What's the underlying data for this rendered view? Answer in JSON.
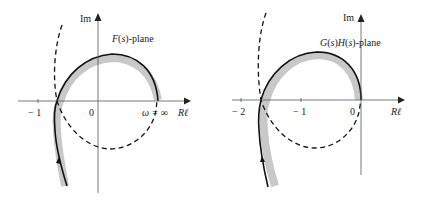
{
  "figures": [
    {
      "id": "left",
      "plane_label": "F(s)-plane",
      "plane_label_parts": {
        "fn": "F",
        "arg": "s",
        "suffix": "-plane"
      },
      "axis_im_label": "Im",
      "axis_re_label": "Rℓ",
      "ticks": [
        {
          "value": -1,
          "label": "− 1"
        },
        {
          "value": 0,
          "label": "0"
        }
      ],
      "annotation": "ω = ∞",
      "curve_style": {
        "solid": "#111111",
        "shade": "#c8c8c8",
        "dashed": "#111111"
      }
    },
    {
      "id": "right",
      "plane_label": "G(s)H(s)-plane",
      "plane_label_parts": {
        "fn": "G",
        "arg": "s",
        "fn2": "H",
        "arg2": "s",
        "suffix": "-plane"
      },
      "axis_im_label": "Im",
      "axis_re_label": "Rℓ",
      "ticks": [
        {
          "value": -2,
          "label": "− 2"
        },
        {
          "value": -1,
          "label": "− 1"
        },
        {
          "value": 0,
          "label": "0"
        }
      ],
      "curve_style": {
        "solid": "#111111",
        "shade": "#c8c8c8",
        "dashed": "#111111"
      }
    }
  ]
}
